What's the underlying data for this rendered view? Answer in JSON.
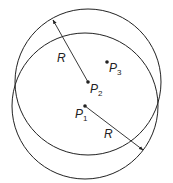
{
  "diagram": {
    "circles": [
      {
        "name": "circle-centered-p2",
        "cx": 88,
        "cy": 82,
        "r": 73
      },
      {
        "name": "circle-centered-p1",
        "cx": 85,
        "cy": 106,
        "r": 73
      }
    ],
    "points": [
      {
        "label": "P",
        "sub": "1",
        "x": 85,
        "y": 106
      },
      {
        "label": "P",
        "sub": "2",
        "x": 88,
        "y": 82
      },
      {
        "label": "P",
        "sub": "3",
        "x": 107,
        "y": 62
      }
    ],
    "radius_labels": [
      "R",
      "R"
    ],
    "stroke_color": "#222222"
  }
}
